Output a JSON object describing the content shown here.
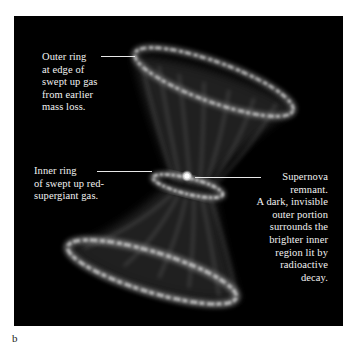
{
  "figure": {
    "panel_letter": "b",
    "background_color": "#000000",
    "labels": {
      "outer_ring": "Outer ring\nat edge of\nswept up gas\nfrom earlier\nmass loss.",
      "inner_ring": "Inner ring\nof swept up red-\nsupergiant gas.",
      "supernova": "Supernova\nremnant.\nA dark, invisible\nouter portion\nsurrounds the\nbrighter inner\nregion lit by\nradioactive\ndecay."
    },
    "colors": {
      "label_text": "#f2f2f2",
      "leader_line": "#e8e8e8",
      "ring_glow": "#bfbfbf",
      "remnant_core": "#ffffff"
    }
  }
}
